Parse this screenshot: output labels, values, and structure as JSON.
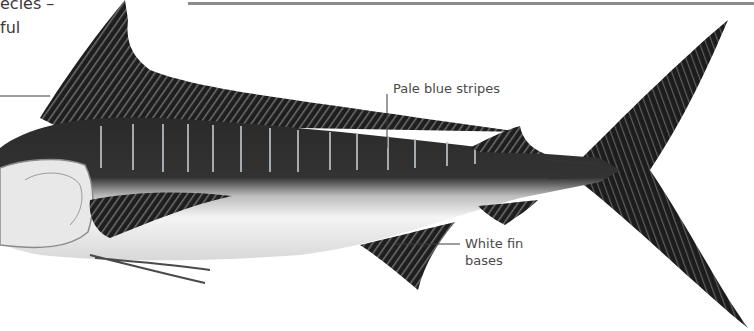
{
  "intro_text": {
    "line1": "ecies –",
    "line2": "ful"
  },
  "labels": {
    "pale_blue_stripes": "Pale blue stripes",
    "white_fin_bases_line1": "White fin",
    "white_fin_bases_line2": "bases"
  },
  "colors": {
    "rule": "#8c8c8c",
    "fin_dark": "#1e1e1e",
    "body_dark": "#2a2a2a",
    "belly": "#f2f2f2",
    "stripe": "#b9c2c8",
    "leader": "#3a3a3a"
  }
}
